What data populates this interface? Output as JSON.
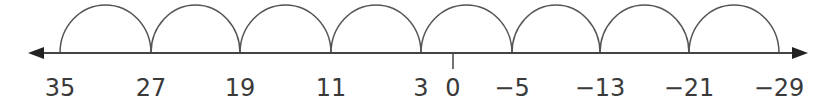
{
  "diagram": {
    "type": "number-line",
    "colors": {
      "line": "#444444",
      "arc": "#555555",
      "text": "#3a3a3a"
    },
    "axis": {
      "y": 53,
      "x_start": 28,
      "x_end": 808
    },
    "zero_tick": {
      "label": "0",
      "x": 453
    },
    "points": [
      {
        "label": "35",
        "value": 35,
        "x": 60
      },
      {
        "label": "27",
        "value": 27,
        "x": 151
      },
      {
        "label": "19",
        "value": 19,
        "x": 240
      },
      {
        "label": "11",
        "value": 11,
        "x": 331
      },
      {
        "label": "3",
        "value": 3,
        "x": 421
      },
      {
        "label": "−5",
        "value": -5,
        "x": 512
      },
      {
        "label": "−13",
        "value": -13,
        "x": 600
      },
      {
        "label": "−21",
        "value": -21,
        "x": 689
      },
      {
        "label": "−29",
        "value": -29,
        "x": 779
      }
    ],
    "hop_size": -8,
    "hops": 8
  }
}
